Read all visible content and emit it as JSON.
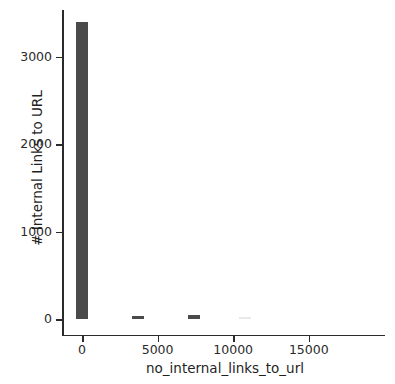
{
  "chart_data": {
    "type": "bar",
    "title": "",
    "subtitle": "",
    "xlabel": "no_internal_links_to_url",
    "ylabel": "# Internal Links to URL",
    "xlim": [
      -1050,
      19250
    ],
    "ylim": [
      -170,
      3590
    ],
    "xticks": [
      0,
      5000,
      10000,
      15000
    ],
    "xtick_labels": [
      "0",
      "5000",
      "10000",
      "15000"
    ],
    "yticks": [
      0,
      1000,
      2000,
      3000
    ],
    "ytick_labels": [
      "0",
      "1000",
      "2000",
      "3000"
    ],
    "grid": false,
    "legend": null,
    "bar_color": "#4a4a4a",
    "bin_width": 800,
    "categories": [
      0,
      3700,
      7400,
      10800
    ],
    "values": [
      3400,
      40,
      45,
      8
    ],
    "series": [
      {
        "name": "no_internal_links_to_url",
        "bars": [
          {
            "x": 0,
            "value": 3400,
            "opacity": 1.0
          },
          {
            "x": 3700,
            "value": 40,
            "opacity": 1.0
          },
          {
            "x": 7400,
            "value": 45,
            "opacity": 1.0
          },
          {
            "x": 10800,
            "value": 8,
            "opacity": 0.12
          }
        ]
      }
    ]
  },
  "axes": {
    "x_axis_name": "x-axis",
    "y_axis_name": "y-axis"
  }
}
